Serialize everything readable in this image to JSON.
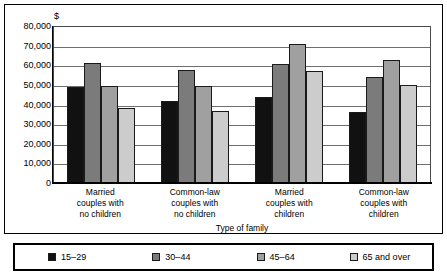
{
  "chart_data": {
    "type": "bar",
    "title": "",
    "xlabel": "Type of family",
    "ylabel": "$",
    "unit_label": "$",
    "ylim": [
      0,
      80000
    ],
    "ytick_step": 10000,
    "grid": true,
    "legend_position": "bottom",
    "categories": [
      "Married couples with no children",
      "Common-law couples with no children",
      "Married couples with children",
      "Common-law couples with children"
    ],
    "category_lines": [
      [
        "Married",
        "couples with",
        "no children"
      ],
      [
        "Common-law",
        "couples with",
        "no children"
      ],
      [
        "Married",
        "couples with",
        "children"
      ],
      [
        "Common-law",
        "couples with",
        "children"
      ]
    ],
    "ytick_labels": [
      "80,000",
      "70,000",
      "60,000",
      "50,000",
      "40,000",
      "30,000",
      "20,000",
      "10,000",
      "0"
    ],
    "ytick_values": [
      80000,
      70000,
      60000,
      50000,
      40000,
      30000,
      20000,
      10000,
      0
    ],
    "series": [
      {
        "name": "15–29",
        "color": "#111111",
        "values": [
          48500,
          41500,
          43500,
          35500
        ]
      },
      {
        "name": "30–44",
        "color": "#7b7b7b",
        "values": [
          60800,
          57000,
          60000,
          53500
        ]
      },
      {
        "name": "45–64",
        "color": "#a0a0a0",
        "values": [
          48800,
          48800,
          70500,
          62000
        ]
      },
      {
        "name": "65 and over",
        "color": "#cccccc",
        "values": [
          37500,
          36000,
          56500,
          49500
        ]
      }
    ]
  }
}
